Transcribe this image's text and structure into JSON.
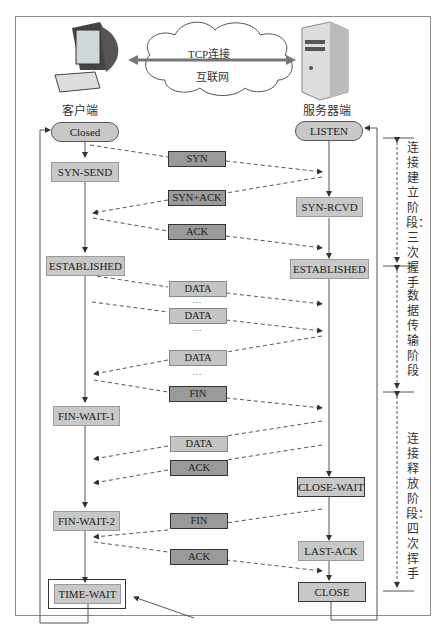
{
  "header": {
    "client_label": "客户端",
    "server_label": "服务器端",
    "connection_label": "TCP连接",
    "network_label": "互联网"
  },
  "client_states": [
    {
      "id": "closed",
      "label": "Closed"
    },
    {
      "id": "syn-send",
      "label": "SYN-SEND"
    },
    {
      "id": "established",
      "label": "ESTABLISHED"
    },
    {
      "id": "fin-wait-1",
      "label": "FIN-WAIT-1"
    },
    {
      "id": "fin-wait-2",
      "label": "FIN-WAIT-2"
    },
    {
      "id": "time-wait",
      "label": "TIME-WAIT"
    }
  ],
  "server_states": [
    {
      "id": "listen",
      "label": "LISTEN"
    },
    {
      "id": "syn-rcvd",
      "label": "SYN-RCVD"
    },
    {
      "id": "established",
      "label": "ESTABLISHED"
    },
    {
      "id": "close-wait",
      "label": "CLOSE-WAIT"
    },
    {
      "id": "last-ack",
      "label": "LAST-ACK"
    },
    {
      "id": "close",
      "label": "CLOSE"
    }
  ],
  "messages": [
    {
      "label": "SYN",
      "direction": "client-to-server"
    },
    {
      "label": "SYN+ACK",
      "direction": "server-to-client"
    },
    {
      "label": "ACK",
      "direction": "client-to-server"
    },
    {
      "label": "DATA",
      "direction": "client-to-server"
    },
    {
      "label": "DATA",
      "direction": "client-to-server"
    },
    {
      "label": "DATA",
      "direction": "server-to-client"
    },
    {
      "label": "FIN",
      "direction": "client-to-server"
    },
    {
      "label": "DATA",
      "direction": "server-to-client"
    },
    {
      "label": "ACK",
      "direction": "server-to-client"
    },
    {
      "label": "FIN",
      "direction": "server-to-client"
    },
    {
      "label": "ACK",
      "direction": "client-to-server"
    }
  ],
  "ellipsis": "···",
  "phases": [
    {
      "label": "连接建立阶段：三次握手"
    },
    {
      "label": "数据传输阶段"
    },
    {
      "label": "连接释放阶段：四次挥手"
    }
  ],
  "colors": {
    "state_fill": "#c8c8c8",
    "message_fill_dark": "#9a9a9a",
    "message_fill_light": "#c4c4c4",
    "line": "#444444"
  }
}
